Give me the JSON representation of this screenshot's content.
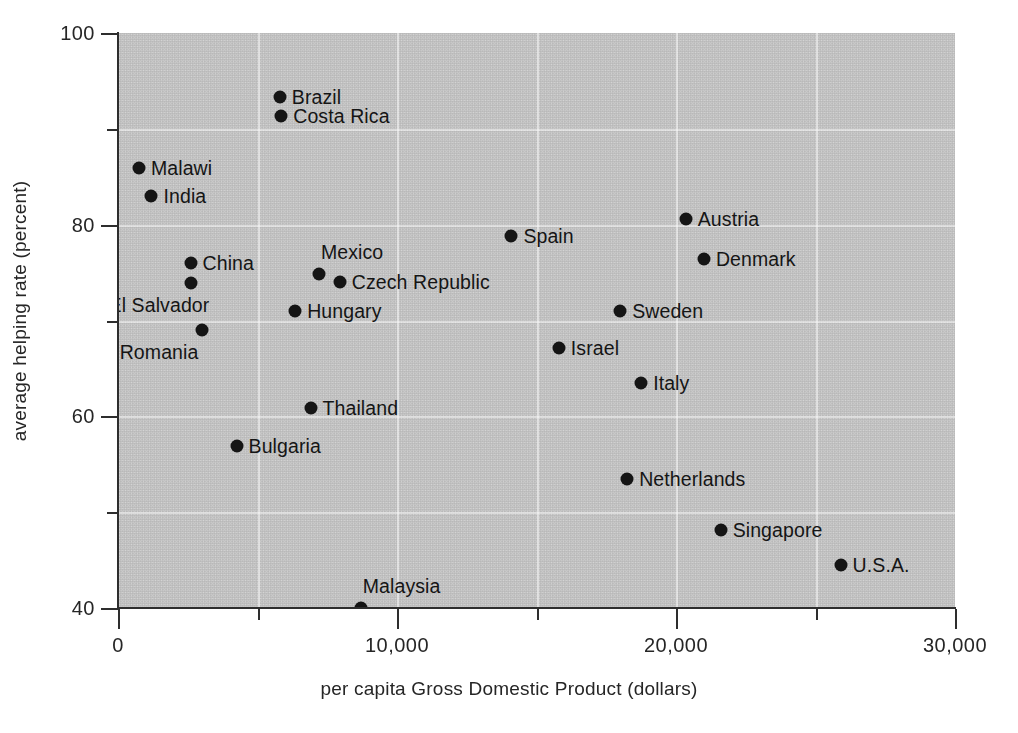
{
  "chart_data": {
    "type": "scatter",
    "title": "",
    "xlabel": "per capita Gross Domestic Product (dollars)",
    "ylabel": "average  helping rate (percent)",
    "xlim": [
      0,
      30000
    ],
    "ylim": [
      40,
      100
    ],
    "x_major_ticks": [
      0,
      10000,
      20000,
      30000
    ],
    "x_major_tick_labels": [
      "0",
      "10,000",
      "20,000",
      "30,000"
    ],
    "x_minor_ticks": [
      5000,
      15000,
      25000
    ],
    "y_major_ticks": [
      40,
      60,
      80,
      100
    ],
    "y_major_tick_labels": [
      "40",
      "60",
      "80",
      "100"
    ],
    "y_minor_ticks": [
      50,
      70,
      90
    ],
    "grid": true,
    "grid_x": [
      5000,
      10000,
      15000,
      20000,
      25000
    ],
    "grid_y": [
      50,
      60,
      70,
      80,
      90
    ],
    "legend": "none",
    "marker": "filled-circle",
    "marker_color": "#111111",
    "plot_background": "#c8c8c8",
    "points": [
      {
        "label": "Brazil",
        "x": 5800,
        "y": 93.3,
        "label_side": "right"
      },
      {
        "label": "Costa Rica",
        "x": 5850,
        "y": 91.3,
        "label_side": "right"
      },
      {
        "label": "Malawi",
        "x": 750,
        "y": 85.9,
        "label_side": "right"
      },
      {
        "label": "India",
        "x": 1200,
        "y": 83.0,
        "label_side": "right"
      },
      {
        "label": "Austria",
        "x": 20350,
        "y": 80.6,
        "label_side": "right"
      },
      {
        "label": "Spain",
        "x": 14100,
        "y": 78.8,
        "label_side": "right"
      },
      {
        "label": "Denmark",
        "x": 21000,
        "y": 76.4,
        "label_side": "right"
      },
      {
        "label": "China",
        "x": 2600,
        "y": 76.0,
        "label_side": "right"
      },
      {
        "label": "Mexico",
        "x": 7200,
        "y": 74.9,
        "label_side": "above"
      },
      {
        "label": "Czech Republic",
        "x": 7950,
        "y": 74.0,
        "label_side": "right"
      },
      {
        "label": "El Salvador",
        "x": 2600,
        "y": 73.9,
        "label_side": "below"
      },
      {
        "label": "Sweden",
        "x": 18000,
        "y": 71.0,
        "label_side": "right"
      },
      {
        "label": "Hungary",
        "x": 6350,
        "y": 71.0,
        "label_side": "right"
      },
      {
        "label": "Israel",
        "x": 15800,
        "y": 67.1,
        "label_side": "right"
      },
      {
        "label": "Romania",
        "x": 3000,
        "y": 69.0,
        "label_side": "below"
      },
      {
        "label": "Italy",
        "x": 18750,
        "y": 63.5,
        "label_side": "right"
      },
      {
        "label": "Thailand",
        "x": 6900,
        "y": 60.9,
        "label_side": "right"
      },
      {
        "label": "Bulgaria",
        "x": 4250,
        "y": 56.9,
        "label_side": "right"
      },
      {
        "label": "Netherlands",
        "x": 18250,
        "y": 53.5,
        "label_side": "right"
      },
      {
        "label": "Singapore",
        "x": 21600,
        "y": 48.1,
        "label_side": "right"
      },
      {
        "label": "U.S.A.",
        "x": 25900,
        "y": 44.5,
        "label_side": "right"
      },
      {
        "label": "Malaysia",
        "x": 8700,
        "y": 40.0,
        "label_side": "above"
      }
    ]
  }
}
